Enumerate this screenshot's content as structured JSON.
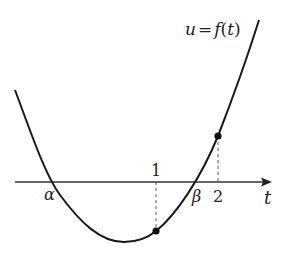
{
  "diagram": {
    "function_label": "u = f(t)",
    "function_label_parts": {
      "u": "u",
      "eq": "=",
      "f": "f",
      "paren_open": "(",
      "t": "t",
      "paren_close": ")"
    },
    "axis_label": "t",
    "roots": [
      {
        "label": "α"
      },
      {
        "label": "β"
      }
    ],
    "ticks": [
      {
        "label": "1"
      },
      {
        "label": "2"
      }
    ],
    "marked_points": [
      {
        "name": "point-t1",
        "t": 1
      },
      {
        "name": "point-t2",
        "t": 2
      }
    ],
    "colors": {
      "curve": "#1a1a1a",
      "axis": "#333333",
      "dashed": "#555555",
      "background": "#ffffff"
    }
  }
}
